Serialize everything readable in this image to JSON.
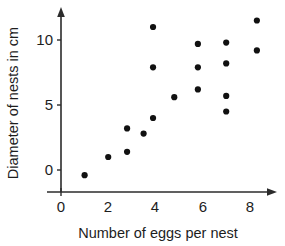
{
  "chart_data": {
    "type": "scatter",
    "title": "",
    "xlabel": "Number of eggs per nest",
    "ylabel": "Diameter of nests in cm",
    "xlim": [
      -0.3,
      8.9
    ],
    "ylim": [
      -1.6,
      12.4
    ],
    "grid": false,
    "legend": null,
    "xticks": [
      0,
      2,
      4,
      6,
      8
    ],
    "xtick_labels": [
      "0",
      "2",
      "4",
      "6",
      "8"
    ],
    "yticks": [
      0,
      5,
      10
    ],
    "ytick_labels": [
      "0",
      "5",
      "10"
    ],
    "marker": "filled-circle",
    "marker_color": "#111111",
    "axis_color": "#2b2b2b",
    "background_color": "#ffffff",
    "n_points": 18,
    "points": [
      {
        "x": 1.0,
        "y": -0.4
      },
      {
        "x": 2.0,
        "y": 1.0
      },
      {
        "x": 2.8,
        "y": 1.4
      },
      {
        "x": 2.8,
        "y": 3.2
      },
      {
        "x": 3.5,
        "y": 2.8
      },
      {
        "x": 3.9,
        "y": 4.0
      },
      {
        "x": 3.9,
        "y": 7.9
      },
      {
        "x": 3.9,
        "y": 11.0
      },
      {
        "x": 4.8,
        "y": 5.6
      },
      {
        "x": 5.8,
        "y": 6.2
      },
      {
        "x": 5.8,
        "y": 7.9
      },
      {
        "x": 5.8,
        "y": 9.7
      },
      {
        "x": 7.0,
        "y": 4.5
      },
      {
        "x": 7.0,
        "y": 5.7
      },
      {
        "x": 7.0,
        "y": 8.2
      },
      {
        "x": 7.0,
        "y": 9.8
      },
      {
        "x": 8.3,
        "y": 9.2
      },
      {
        "x": 8.3,
        "y": 11.5
      }
    ]
  },
  "axes": {
    "x_axis_name": "x-axis",
    "y_axis_name": "y-axis"
  }
}
